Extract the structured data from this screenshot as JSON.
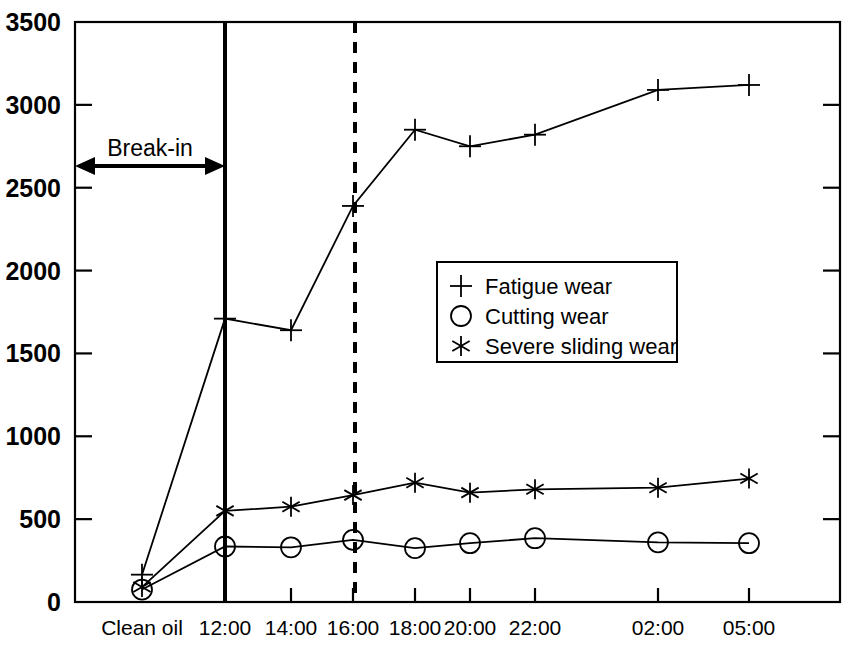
{
  "chart_data": {
    "type": "line",
    "title": "",
    "xlabel": "",
    "ylabel": "",
    "ylim": [
      0,
      3500
    ],
    "grid": false,
    "legend_position": "center-right",
    "categories": [
      "Clean oil",
      "12:00",
      "14:00",
      "16:00",
      "18:00",
      "20:00",
      "22:00",
      "02:00",
      "05:00"
    ],
    "x_positions": [
      142,
      225,
      291,
      353,
      415,
      470,
      535,
      658,
      749
    ],
    "y_ticks": [
      0,
      500,
      1000,
      1500,
      2000,
      2500,
      3000,
      3500
    ],
    "y_tick_labels": [
      "0",
      "500",
      "1000",
      "1500",
      "2000",
      "2500",
      "3000",
      "3500"
    ],
    "series": [
      {
        "name": "Fatigue wear",
        "marker": "plus",
        "values": [
          165,
          1710,
          1640,
          2390,
          2850,
          2750,
          2820,
          3090,
          3120
        ]
      },
      {
        "name": "Cutting wear",
        "marker": "circle",
        "values": [
          75,
          335,
          330,
          375,
          325,
          355,
          385,
          360,
          355
        ]
      },
      {
        "name": "Severe sliding wear",
        "marker": "asterisk",
        "values": [
          90,
          550,
          575,
          645,
          720,
          660,
          680,
          690,
          745
        ]
      }
    ],
    "annotations": [
      {
        "name": "break-in",
        "label": "Break-in",
        "type": "double-arrow",
        "from_x": 75,
        "to_x": 225,
        "y": 166
      },
      {
        "name": "break-in-boundary",
        "type": "vline-solid",
        "x": 225
      },
      {
        "name": "secondary-boundary",
        "type": "vline-dashed",
        "x": 355
      }
    ],
    "colors": {
      "line": "#000000",
      "axis": "#000000",
      "background": "#ffffff"
    }
  },
  "legend": {
    "entries": [
      {
        "symbol": "+",
        "label": "Fatigue wear"
      },
      {
        "symbol": "○",
        "label": "Cutting wear"
      },
      {
        "symbol": "✳",
        "label": "Severe sliding wear"
      }
    ]
  },
  "axis": {
    "y_labels": [
      "3500",
      "3000",
      "2500",
      "2000",
      "1500",
      "1000",
      "500",
      "0"
    ],
    "x_labels": [
      "Clean oil",
      "12:00",
      "14:00",
      "16:00",
      "18:00",
      "20:00",
      "22:00",
      "02:00",
      "05:00"
    ]
  },
  "annotation": {
    "break_in_label": "Break-in"
  }
}
